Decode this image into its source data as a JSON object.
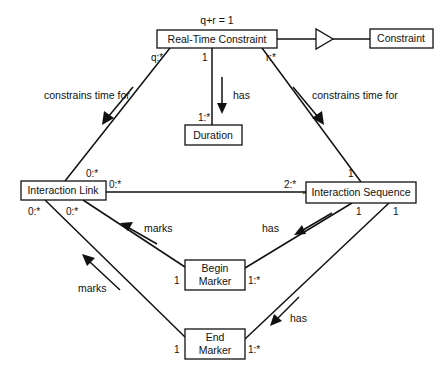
{
  "diagram": {
    "type": "UML class diagram",
    "classes": {
      "real_time_constraint": "Real-Time Constraint",
      "constraint": "Constraint",
      "duration": "Duration",
      "interaction_link": "Interaction Link",
      "interaction_sequence": "Interaction Sequence",
      "begin_marker": [
        "Begin",
        "Marker"
      ],
      "end_marker": [
        "End",
        "Marker"
      ]
    },
    "constraint_note": "q+r = 1",
    "associations": {
      "rtc_to_link": {
        "label": "constrains time for",
        "mult_rtc": "q:*",
        "mult_link": "0:*"
      },
      "rtc_to_sequence": {
        "label": "constrains time for",
        "mult_rtc": "r:*",
        "mult_sequence": "1"
      },
      "rtc_to_duration": {
        "label": "has",
        "mult_rtc": "1",
        "mult_duration": "1:*"
      },
      "link_to_sequence": {
        "mult_link": "0:*",
        "mult_sequence": "2:*"
      },
      "begin_marks_link": {
        "label": "marks",
        "mult_link": "0:*",
        "mult_marker": "1"
      },
      "end_marks_link": {
        "label": "marks",
        "mult_link": "0:*",
        "mult_marker": "1"
      },
      "sequence_has_begin": {
        "label": "has",
        "mult_sequence": "1",
        "mult_marker": "1:*"
      },
      "sequence_has_end": {
        "label": "has",
        "mult_sequence": "1",
        "mult_marker": "1:*"
      }
    },
    "generalization": {
      "child": "Real-Time Constraint",
      "parent": "Constraint"
    }
  }
}
